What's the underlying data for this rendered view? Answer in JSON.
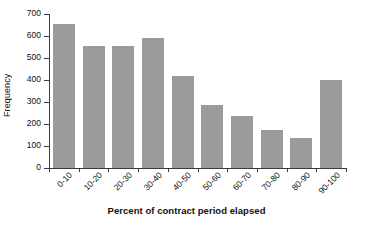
{
  "chart_data": {
    "type": "bar",
    "title": "",
    "xlabel": "Percent of contract period elapsed",
    "ylabel": "Frequency",
    "categories": [
      "0-10",
      "10-20",
      "20-30",
      "30-40",
      "40-50",
      "50-60",
      "60-70",
      "70-80",
      "80-90",
      "90-100"
    ],
    "values": [
      655,
      555,
      555,
      590,
      420,
      285,
      235,
      175,
      135,
      400
    ],
    "ylim": [
      0,
      700
    ],
    "yticks": [
      0,
      100,
      200,
      300,
      400,
      500,
      600,
      700
    ],
    "ytick_labels": [
      "0",
      "100",
      "200",
      "300",
      "400",
      "500",
      "600",
      "700"
    ],
    "grid": false,
    "legend": false,
    "bar_color": "#9b9b9b",
    "axis_color": "#3a3a3a",
    "background": "#ffffff"
  }
}
